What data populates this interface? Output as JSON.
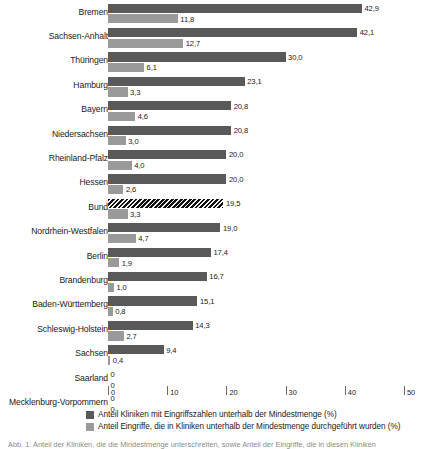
{
  "chart_data": {
    "type": "bar",
    "orientation": "horizontal",
    "title": "",
    "xlabel": "",
    "ylabel": "",
    "xlim": [
      0,
      50
    ],
    "xticks": [
      0,
      10,
      20,
      30,
      40,
      50
    ],
    "grid": false,
    "legend_position": "bottom-left",
    "decimal_separator": ",",
    "categories": [
      "Bremen",
      "Sachsen-Anhalt",
      "Thüringen",
      "Hamburg",
      "Bayern",
      "Niedersachsen",
      "Rheinland-Pfalz",
      "Hessen",
      "Bund",
      "Nordrhein-Westfalen",
      "Berlin",
      "Brandenburg",
      "Baden-Württemberg",
      "Schleswig-Holstein",
      "Sachsen",
      "Saarland",
      "Mecklenburg-Vorpommern"
    ],
    "highlight_category": "Bund",
    "series": [
      {
        "name": "Anteil Kliniken mit Eingriffszahlen unterhalb der Mindestmenge (%)",
        "key": "series-a",
        "color": "#595959",
        "values": [
          42.9,
          42.1,
          30.0,
          23.1,
          20.8,
          20.8,
          20.0,
          20.0,
          19.5,
          19.0,
          17.4,
          16.7,
          15.1,
          14.3,
          9.4,
          0,
          0
        ],
        "labels": [
          "42,9",
          "42,1",
          "30,0",
          "23,1",
          "20,8",
          "20,8",
          "20,0",
          "20,0",
          "19,5",
          "19,0",
          "17,4",
          "16,7",
          "15,1",
          "14,3",
          "9,4",
          "0",
          "0"
        ]
      },
      {
        "name": "Anteil Eingriffe, die in Kliniken unterhalb der Mindestmenge durchgeführt wurden (%)",
        "key": "series-b",
        "color": "#9a9a9a",
        "values": [
          11.8,
          12.7,
          6.1,
          3.3,
          4.6,
          3.0,
          4.0,
          2.6,
          3.3,
          4.7,
          1.9,
          1.0,
          0.8,
          2.7,
          0.4,
          0,
          0
        ],
        "labels": [
          "11,8",
          "12,7",
          "6,1",
          "3,3",
          "4,6",
          "3,0",
          "4,0",
          "2,6",
          "3,3",
          "4,7",
          "1,9",
          "1,0",
          "0,8",
          "2,7",
          "0,4",
          "0",
          "0"
        ]
      }
    ]
  },
  "legend": {
    "items": [
      {
        "label": "Anteil Kliniken mit Eingriffszahlen unterhalb der Mindestmenge (%)",
        "color": "#595959",
        "key": "series-a"
      },
      {
        "label": "Anteil Eingriffe, die in Kliniken unterhalb der Mindestmenge durchgeführt wurden (%)",
        "color": "#9a9a9a",
        "key": "series-b"
      }
    ]
  },
  "caption": {
    "text": "Abb. 1: Anteil der Kliniken, die die Mindestmenge unterschreiten, sowie Anteil der Eingriffe, die in diesen Kliniken"
  }
}
